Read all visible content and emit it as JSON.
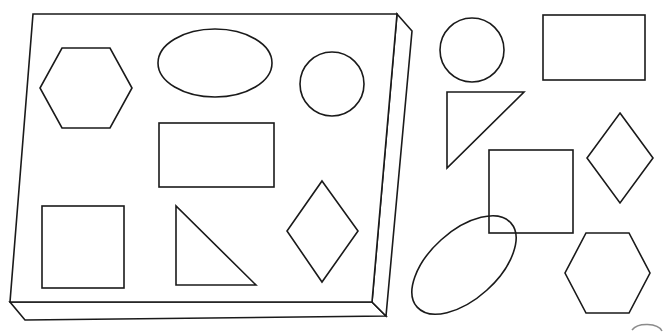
{
  "canvas": {
    "width": 670,
    "height": 333,
    "background_color": "#ffffff",
    "stroke_color": "#1a1a1a",
    "style": "black-and-white line drawing"
  },
  "tray": {
    "label": "3D rectangular tray",
    "top_face_points": "33,14 397,14 372,302 10,302",
    "front_face_points": "10,302 372,302 386,316 25,320",
    "side_face_points": "397,14 412,31 386,316 372,302",
    "depth_px": 15,
    "shape_count": 7
  },
  "tray_shapes": [
    {
      "name": "hexagon",
      "label": "Hexagon",
      "points": "62,48 110,48 132,88 110,128 62,128 40,88"
    },
    {
      "name": "ellipse",
      "label": "Ellipse",
      "cx": 215,
      "cy": 63,
      "rx": 57,
      "ry": 34,
      "rotation": 0
    },
    {
      "name": "circle",
      "label": "Circle",
      "cx": 332,
      "cy": 84,
      "r": 32
    },
    {
      "name": "rectangle",
      "label": "Rectangle",
      "x": 159,
      "y": 123,
      "width": 115,
      "height": 64
    },
    {
      "name": "square",
      "label": "Square",
      "x": 42,
      "y": 206,
      "width": 82,
      "height": 82
    },
    {
      "name": "right-triangle",
      "label": "Right triangle",
      "points": "176,206 176,285 256,285"
    },
    {
      "name": "diamond",
      "label": "Diamond",
      "points": "322,181 358,231 322,282 287,231"
    }
  ],
  "loose_shapes": [
    {
      "name": "circle",
      "label": "Circle",
      "cx": 472,
      "cy": 50,
      "r": 32
    },
    {
      "name": "rectangle",
      "label": "Rectangle",
      "x": 543,
      "y": 15,
      "width": 102,
      "height": 65
    },
    {
      "name": "right-triangle",
      "label": "Right triangle",
      "points": "447,92 524,92 447,168"
    },
    {
      "name": "diamond",
      "label": "Diamond",
      "points": "620,113 653,158 620,203 587,158"
    },
    {
      "name": "square",
      "label": "Square",
      "x": 489,
      "y": 150,
      "width": 84,
      "height": 83
    },
    {
      "name": "ellipse",
      "label": "Tilted ellipse",
      "cx": 464,
      "cy": 265,
      "rx": 63,
      "ry": 34,
      "rotation": -42
    },
    {
      "name": "hexagon",
      "label": "Hexagon",
      "points": "586,233 629,233 650,273 629,313 586,313 565,273"
    }
  ],
  "partial_marks": [
    {
      "name": "cropped-arc",
      "label": "Partial arc at bottom-right edge",
      "path": "M 632 330 A 16 9 0 0 1 662 331"
    }
  ]
}
